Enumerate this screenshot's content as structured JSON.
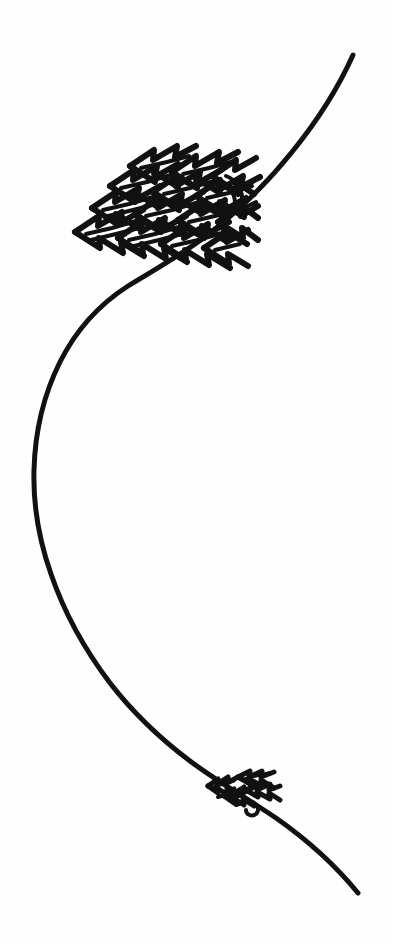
{
  "artwork": {
    "title": "Hand-drawn ink illustration",
    "subject": "S-curved line with two clusters of arrowhead chevron forms",
    "medium": "pen and ink line drawing",
    "background_color": "#fefefe",
    "ink_color": "#111111",
    "canvas": {
      "width": 393,
      "height": 945
    },
    "elements": [
      {
        "name": "main-curve",
        "description": "Long sinuous S-shaped stroke running from upper right down to lower right",
        "stroke_width": 5,
        "start_point": [
          353,
          55
        ],
        "end_point": [
          358,
          893
        ],
        "leftmost_point": [
          34,
          490
        ],
        "path": "M 353 55 C 333 95 300 140 268 178 C 236 216 196 249 160 272 C 118 299 82 340 58 390 C 38 432 32 462 34 492 C 36 530 46 566 62 602 C 84 652 118 698 156 735 C 186 764 216 785 248 806 C 286 831 330 862 358 893"
      },
      {
        "name": "upper-arrow-cluster",
        "description": "Dense diagonal band of overlapping left-pointing arrowhead chevrons resting on the upper curve",
        "bounds": [
          70,
          142,
          190,
          130
        ],
        "rows": 4,
        "arrows_per_row": 5,
        "direction": "left"
      },
      {
        "name": "lower-arrow-cluster",
        "description": "Small distant cluster of the same arrowhead chevrons on the lower curve",
        "bounds": [
          205,
          766,
          78,
          58
        ],
        "rows": 3,
        "arrows_per_row": 3,
        "direction": "left"
      }
    ]
  }
}
